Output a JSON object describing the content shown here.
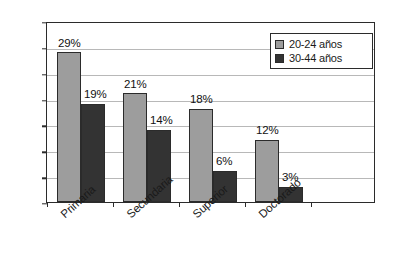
{
  "chart_data": {
    "type": "bar",
    "title": "",
    "subtitle": "",
    "xlabel": "",
    "ylabel": "",
    "categories": [
      "Primaria",
      "Secundaria",
      "Superior",
      "Doctorado"
    ],
    "series": [
      {
        "name": "20-24 años",
        "color": "#9d9d9d",
        "values": [
          29,
          21,
          18,
          12
        ],
        "labels": [
          "29%",
          "21%",
          "18%",
          "12%"
        ]
      },
      {
        "name": "30-44 años",
        "color": "#333333",
        "values": [
          19,
          14,
          6,
          3
        ],
        "labels": [
          "19%",
          "14%",
          "6%",
          "3%"
        ]
      }
    ],
    "ylim": [
      0,
      35
    ],
    "ytick_values": [
      0,
      5,
      10,
      15,
      20,
      25,
      30,
      35
    ],
    "ytick_labels": [
      "0%",
      "5%",
      "10%",
      "15%",
      "20%",
      "25%",
      "30%",
      "35%"
    ],
    "grid": true,
    "grid_axis": "y",
    "legend_position": "top-right",
    "legend_entries": [
      "20-24 años",
      "30-44 años"
    ],
    "value_labels_shown": true,
    "value_label_unit": "%",
    "plot_border": true,
    "background_color": "#ffffff",
    "grid_color": "#b8b8b8",
    "axis_color": "#2b2b2b"
  }
}
